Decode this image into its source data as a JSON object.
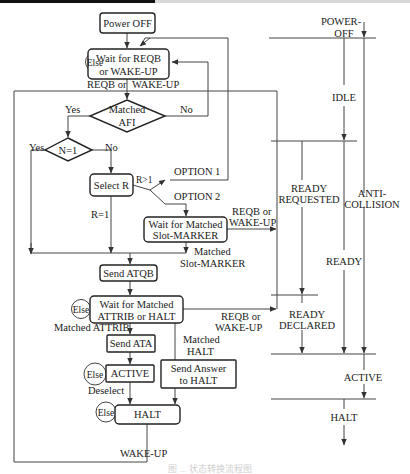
{
  "flowchart": {
    "nodes": {
      "power_off": "Power OFF",
      "wait_reqb_1": "Wait for REQB",
      "wait_reqb_2": "or WAKE-UP",
      "matched_afi_1": "Matched",
      "matched_afi_2": "AFI",
      "n_eq_1": "N=1",
      "select_r": "Select R",
      "wait_slot_1": "Wait for Matched",
      "wait_slot_2": "Slot-MARKER",
      "send_atqb": "Send ATQB",
      "wait_attrib_1": "Wait for Matched",
      "wait_attrib_2": "ATTRIB or HALT",
      "send_ata": "Send ATA",
      "active": "ACTIVE",
      "send_answer_1": "Send Answer",
      "send_answer_2": "to HALT",
      "halt": "HALT"
    },
    "labels": {
      "else": "Else",
      "reqb_or": "REQB or",
      "wake_up": "WAKE-UP",
      "yes": "Yes",
      "no": "No",
      "r_gt_1": "R>1",
      "r_eq_1": "R=1",
      "option_1": "OPTION 1",
      "option_2": "OPTION 2",
      "matched": "Matched",
      "slot_marker": "Slot-MARKER",
      "matched_attrib": "Matched ATTRIB",
      "matched_halt_1": "Matched",
      "matched_halt_2": "HALT",
      "deselect": "Deselect",
      "wake_up_bottom": "WAKE-UP"
    }
  },
  "state_timeline": {
    "power_off_1": "POWER-",
    "power_off_2": "OFF",
    "idle": "IDLE",
    "ready_requested_1": "READY",
    "ready_requested_2": "REQUESTED",
    "anti_collision_1": "ANTI-",
    "anti_collision_2": "COLLISION",
    "ready": "READY",
    "ready_declared_1": "READY",
    "ready_declared_2": "DECLARED",
    "active": "ACTIVE",
    "halt": "HALT"
  },
  "caption": "图 ... 状态转换流程图"
}
